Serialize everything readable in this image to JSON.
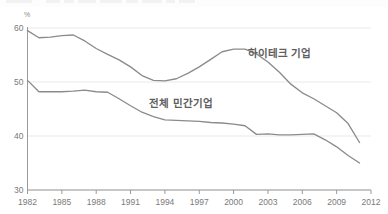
{
  "chart_data": {
    "type": "line",
    "title": "",
    "subtitle": "",
    "xlabel": "",
    "ylabel": "",
    "yunit": "%",
    "xlim": [
      1982,
      2012
    ],
    "ylim": [
      30,
      60
    ],
    "grid": true,
    "gridlines_y": [
      30,
      40,
      50,
      60
    ],
    "yticks": [
      30,
      40,
      50,
      60
    ],
    "ytick_labels": [
      "30",
      "40",
      "50",
      "60"
    ],
    "xticks": [
      1982,
      1985,
      1988,
      1991,
      1994,
      1997,
      2000,
      2003,
      2006,
      2009,
      2012
    ],
    "xtick_labels": [
      "1982",
      "1985",
      "1988",
      "1991",
      "1994",
      "1997",
      "2000",
      "2003",
      "2006",
      "2009",
      "2012"
    ],
    "legend_position": "inline-annotation",
    "line_color": "#8b8b8b",
    "grid_color": "#e9e9ec",
    "axis_color": "#9a9a9a",
    "series": [
      {
        "name": "하이테크 기업",
        "label_x": 2004.0,
        "label_y": 54.6,
        "x": [
          1982,
          1983,
          1984,
          1985,
          1986,
          1987,
          1988,
          1989,
          1990,
          1991,
          1992,
          1993,
          1994,
          1995,
          1996,
          1997,
          1998,
          1999,
          2000,
          2001,
          2002,
          2003,
          2004,
          2005,
          2006,
          2007,
          2008,
          2009,
          2010,
          2011
        ],
        "values": [
          59.5,
          58.2,
          58.3,
          58.6,
          58.7,
          57.6,
          56.2,
          55.1,
          54.1,
          52.8,
          51.2,
          50.3,
          50.2,
          50.6,
          51.6,
          52.8,
          54.2,
          55.6,
          56.1,
          56.1,
          55.2,
          53.7,
          51.8,
          49.6,
          48.0,
          46.9,
          45.6,
          44.3,
          42.3,
          38.8
        ]
      },
      {
        "name": "전체 민간기업",
        "label_x": 1995.4,
        "label_y": 45.3,
        "x": [
          1982,
          1983,
          1984,
          1985,
          1986,
          1987,
          1988,
          1989,
          1990,
          1991,
          1992,
          1993,
          1994,
          1995,
          1996,
          1997,
          1998,
          1999,
          2000,
          2001,
          2002,
          2003,
          2004,
          2005,
          2006,
          2007,
          2008,
          2009,
          2010,
          2011
        ],
        "values": [
          50.3,
          48.2,
          48.2,
          48.2,
          48.3,
          48.5,
          48.2,
          48.1,
          46.9,
          45.6,
          44.4,
          43.6,
          43.0,
          42.9,
          42.8,
          42.7,
          42.5,
          42.4,
          42.2,
          41.9,
          40.3,
          40.4,
          40.2,
          40.2,
          40.3,
          40.4,
          39.3,
          38.0,
          36.4,
          35.0
        ]
      }
    ]
  },
  "axis": {
    "unit_symbol": "%"
  }
}
